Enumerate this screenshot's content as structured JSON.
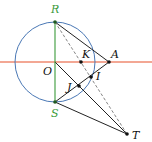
{
  "diagram": {
    "type": "geometry",
    "colors": {
      "circle": "#4a78b5",
      "axis_line": "#e8502a",
      "vertical": "#3a9a3a",
      "segments": "#222222",
      "dashed": "#777777",
      "point": "#111111",
      "label_green": "#3a9a3a",
      "label_black": "#111111"
    },
    "circle": {
      "center": "O",
      "cx": 55,
      "cy": 62,
      "r": 40
    },
    "points": [
      {
        "name": "R",
        "label": "R",
        "x": 55,
        "y": 22,
        "lx": 51,
        "ly": 13,
        "color": "green"
      },
      {
        "name": "S",
        "label": "S",
        "x": 55,
        "y": 102,
        "lx": 51,
        "ly": 117,
        "color": "green"
      },
      {
        "name": "O",
        "label": "O",
        "x": 55,
        "y": 62,
        "lx": 43,
        "ly": 75,
        "color": "black"
      },
      {
        "name": "K",
        "label": "K",
        "x": 81,
        "y": 62,
        "lx": 82,
        "ly": 58,
        "color": "black"
      },
      {
        "name": "A",
        "label": "A",
        "x": 109,
        "y": 62,
        "lx": 111,
        "ly": 58,
        "color": "black"
      },
      {
        "name": "I",
        "label": "I",
        "x": 91,
        "y": 77,
        "lx": 96,
        "ly": 80,
        "color": "black"
      },
      {
        "name": "J",
        "label": "J",
        "x": 79,
        "y": 86,
        "lx": 67,
        "ly": 91,
        "color": "black"
      },
      {
        "name": "T",
        "label": "T",
        "x": 127,
        "y": 134,
        "lx": 132,
        "ly": 139,
        "color": "black"
      }
    ],
    "segments": [
      {
        "from": "R",
        "to": "A",
        "style": "solid"
      },
      {
        "from": "A",
        "to": "S",
        "style": "solid"
      },
      {
        "from": "O",
        "to": "T",
        "style": "solid"
      },
      {
        "from": "S",
        "to": "T",
        "style": "solid"
      },
      {
        "from": "R",
        "to": "S",
        "style": "solid-green"
      },
      {
        "from": "R",
        "to": "T",
        "style": "dashed"
      }
    ],
    "line": {
      "name": "horizontal-axis",
      "y": 62,
      "x1": 0,
      "x2": 152
    }
  }
}
